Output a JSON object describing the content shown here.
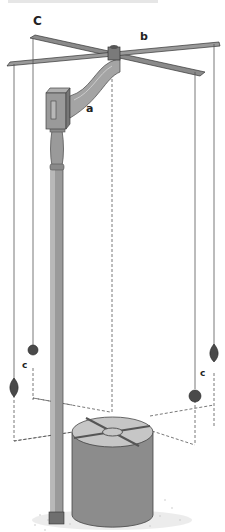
{
  "figure": {
    "labels": {
      "arm": "a",
      "cross": "b",
      "corner_top": "C",
      "plumb_left": "c",
      "plumb_right": "c"
    },
    "colors": {
      "wood": "#9a9a9a",
      "wood_dark": "#6f6f6f",
      "wood_light": "#b8b8b8",
      "bob": "#4a4a4a",
      "line": "#555555",
      "base_side": "#8c8c8c",
      "base_top": "#c6c6c6",
      "ground": "#9d9d9d"
    }
  }
}
